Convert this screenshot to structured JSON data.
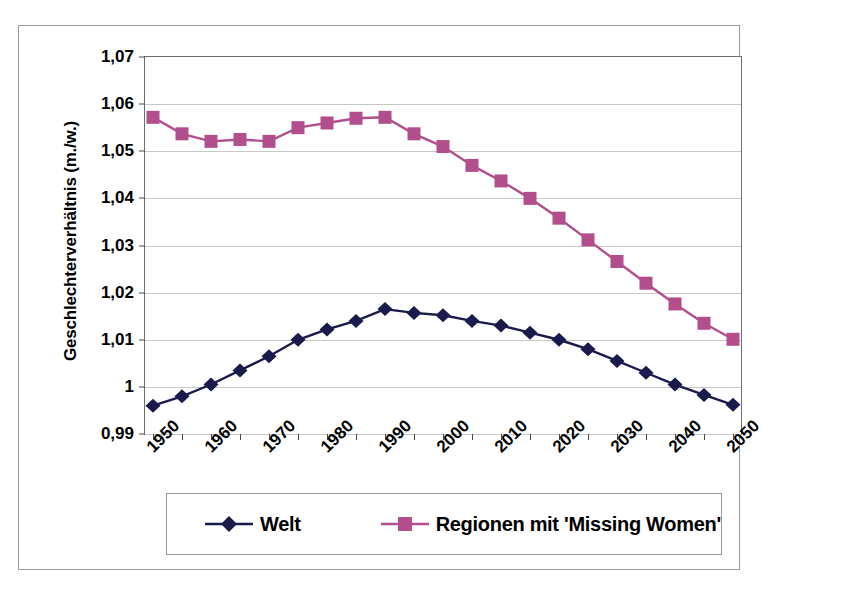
{
  "chart_data": {
    "type": "line",
    "title": "",
    "xlabel": "",
    "ylabel": "Geschlechterverhältnis (m./w.)",
    "ylim": [
      0.99,
      1.07
    ],
    "ytick_labels": [
      "1,07",
      "1,06",
      "1,05",
      "1,04",
      "1,03",
      "1,02",
      "1,01",
      "1",
      "0,99"
    ],
    "ytick_values": [
      1.07,
      1.06,
      1.05,
      1.04,
      1.03,
      1.02,
      1.01,
      1.0,
      0.99
    ],
    "xtick_labels": [
      "1950",
      "1960",
      "1970",
      "1980",
      "1990",
      "2000",
      "2010",
      "2020",
      "2030",
      "2040",
      "2050"
    ],
    "x": [
      1955,
      1960,
      1965,
      1970,
      1975,
      1980,
      1985,
      1990,
      1995,
      2000,
      2005,
      2010,
      2015,
      2020,
      2025,
      2030,
      2035,
      2040,
      2045,
      2050,
      2055
    ],
    "grid": true,
    "legend_position": "bottom",
    "series": [
      {
        "name": "Welt",
        "color": "#1a1a4d",
        "marker": "diamond",
        "values": [
          0.996,
          0.998,
          1.0005,
          1.0035,
          1.0065,
          1.01,
          1.0122,
          1.014,
          1.0165,
          1.0157,
          1.0152,
          1.014,
          1.013,
          1.0115,
          1.01,
          1.008,
          1.0055,
          1.003,
          1.0005,
          0.9983,
          0.9962
        ]
      },
      {
        "name": "Regionen mit 'Missing Women'",
        "color": "#b34e8c",
        "marker": "square",
        "values": [
          1.0572,
          1.0537,
          1.0521,
          1.0525,
          1.0521,
          1.055,
          1.056,
          1.057,
          1.0572,
          1.0537,
          1.051,
          1.047,
          1.0437,
          1.04,
          1.0358,
          1.0312,
          1.0266,
          1.022,
          1.0176,
          1.0135,
          1.0101
        ]
      }
    ]
  },
  "legend": {
    "entries": [
      {
        "label": "Welt",
        "marker": "diamond-marker",
        "color": "#1a1a4d"
      },
      {
        "label": "Regionen mit 'Missing Women'",
        "marker": "square-marker",
        "color": "#b34e8c"
      }
    ]
  }
}
